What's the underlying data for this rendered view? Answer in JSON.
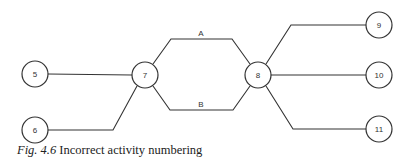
{
  "diagram": {
    "nodes": [
      {
        "id": "5",
        "label": "5",
        "x": 35,
        "y": 74
      },
      {
        "id": "6",
        "label": "6",
        "x": 35,
        "y": 130
      },
      {
        "id": "7",
        "label": "7",
        "x": 145,
        "y": 75
      },
      {
        "id": "8",
        "label": "8",
        "x": 258,
        "y": 75
      },
      {
        "id": "9",
        "label": "9",
        "x": 379,
        "y": 25
      },
      {
        "id": "10",
        "label": "10",
        "x": 379,
        "y": 75
      },
      {
        "id": "11",
        "label": "11",
        "x": 379,
        "y": 129
      }
    ],
    "edges": [
      {
        "from": "5",
        "to": "7",
        "label": ""
      },
      {
        "from": "6",
        "to": "7",
        "label": ""
      },
      {
        "from": "7",
        "to": "8",
        "label": "A"
      },
      {
        "from": "7",
        "to": "8",
        "label": "B"
      },
      {
        "from": "8",
        "to": "9",
        "label": ""
      },
      {
        "from": "8",
        "to": "10",
        "label": ""
      },
      {
        "from": "8",
        "to": "11",
        "label": ""
      }
    ],
    "edge_labels": {
      "a": "A",
      "b": "B"
    }
  },
  "caption": {
    "figure": "Fig. 4.6",
    "text": "Incorrect activity numbering"
  }
}
